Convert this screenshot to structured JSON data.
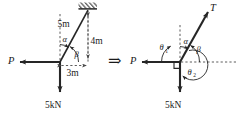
{
  "figure": {
    "caption": "Force system at a pin joint resolved into a free-body diagram",
    "implies_symbol": "⇒",
    "colors": {
      "stroke": "#262626",
      "dashed": "#4a4a4a",
      "text": "#1a1a1a",
      "background": "#ffffff"
    }
  },
  "left_diagram": {
    "name": "space-diagram",
    "labels": {
      "hypotenuse_length": "5m",
      "vertical_length": "4m",
      "horizontal_length": "3m",
      "angle_alpha": "α",
      "angle_beta": "β",
      "force_p": "P",
      "force_weight": "5kN"
    },
    "support": {
      "type": "fixed-hatched-support"
    }
  },
  "right_diagram": {
    "name": "free-body-diagram",
    "labels": {
      "tension": "T",
      "angle_alpha": "α",
      "angle_beta": "β",
      "angle_theta_1": "θ",
      "angle_theta_1_sub": "1",
      "angle_theta_2": "θ",
      "angle_theta_2_sub": "2",
      "force_p": "P",
      "force_weight": "5kN"
    },
    "right_angle_marker": "right-angle-square"
  }
}
